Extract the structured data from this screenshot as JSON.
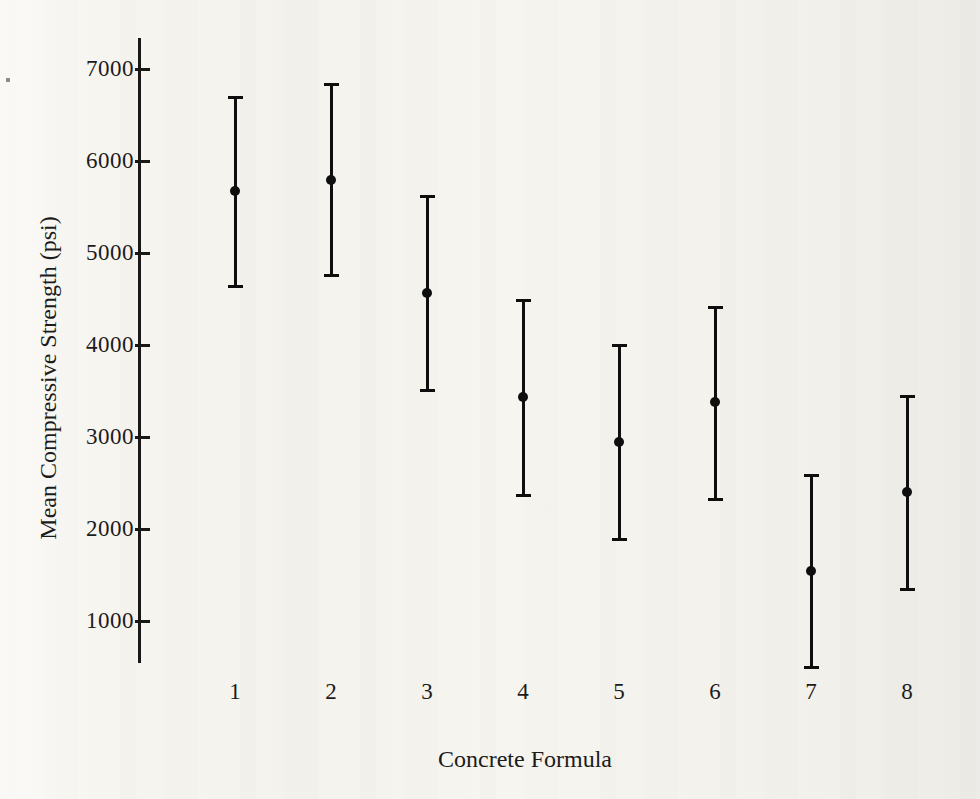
{
  "figure": {
    "kind": "interval-plot",
    "ink_color": "#0e0e0e",
    "paper_color": "#f7f5f0"
  },
  "chart_data": {
    "type": "scatter",
    "subtype": "errorbar-interval-plot",
    "title": "",
    "xlabel": "Concrete Formula",
    "ylabel": "Mean Compressive Strength (psi)",
    "categories": [
      "1",
      "2",
      "3",
      "4",
      "5",
      "6",
      "7",
      "8"
    ],
    "y_ticks": [
      7000,
      6000,
      5000,
      4000,
      3000,
      2000,
      1000
    ],
    "ylim": [
      500,
      7350
    ],
    "grid": false,
    "legend": false,
    "series": [
      {
        "name": "mean",
        "values": [
          5680,
          5800,
          4570,
          3440,
          2950,
          3380,
          1550,
          2410
        ]
      },
      {
        "name": "lower-bound",
        "values": [
          4640,
          4760,
          3510,
          2370,
          1890,
          2320,
          500,
          1350
        ]
      },
      {
        "name": "upper-bound",
        "values": [
          6690,
          6840,
          5620,
          4490,
          4000,
          4410,
          2580,
          3440
        ]
      }
    ]
  }
}
